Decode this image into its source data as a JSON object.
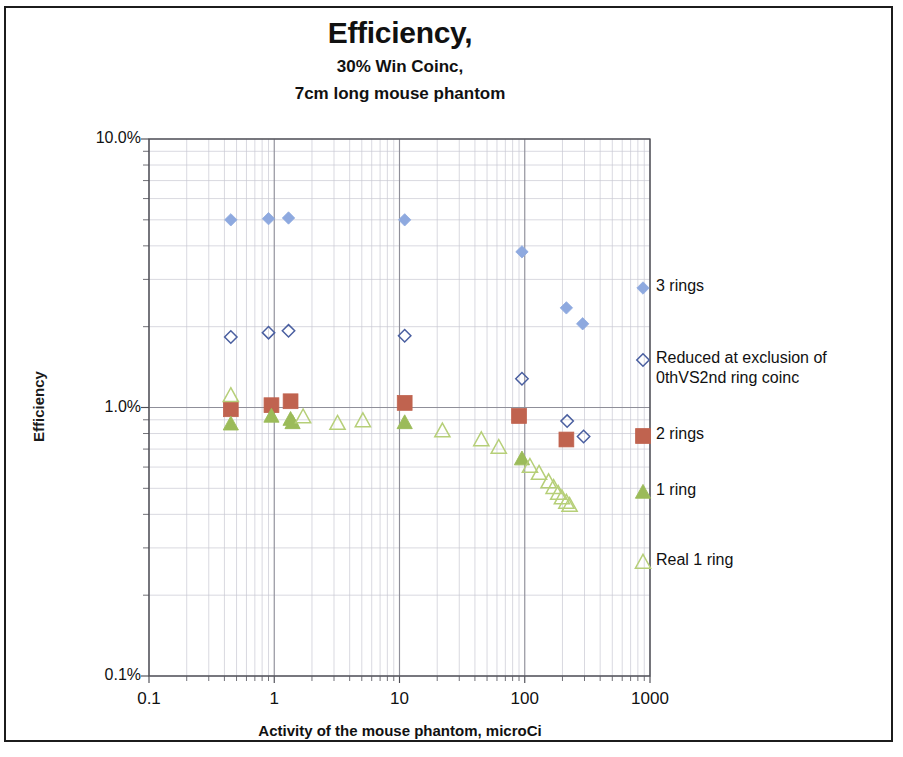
{
  "chart_data": {
    "type": "scatter",
    "title": "Efficiency,",
    "subtitle_line1": "30% Win Coinc,",
    "subtitle_line2": "7cm long mouse phantom",
    "xlabel": "Activity of the mouse phantom, microCi",
    "ylabel": "Efficiency",
    "xscale": "log",
    "yscale": "log",
    "xlim": [
      0.1,
      1000
    ],
    "ylim": [
      0.001,
      0.1
    ],
    "xticks": [
      "0.1",
      "1",
      "10",
      "100",
      "1000"
    ],
    "xtick_values": [
      0.1,
      1,
      10,
      100,
      1000
    ],
    "yticks": [
      "10.0%",
      "1.0%",
      "0.1%"
    ],
    "ytick_values": [
      0.1,
      0.01,
      0.001
    ],
    "grid": true,
    "grid_minor": true,
    "legend_position": "right",
    "series": [
      {
        "name": "3 rings",
        "marker": "filled-diamond",
        "color": "#8EA9DF",
        "points": [
          [
            0.45,
            0.05
          ],
          [
            0.9,
            0.0505
          ],
          [
            1.3,
            0.0508
          ],
          [
            11.0,
            0.05
          ],
          [
            95.0,
            0.038
          ],
          [
            215.0,
            0.0235
          ],
          [
            290.0,
            0.0205
          ]
        ]
      },
      {
        "name": "Reduced at exclusion of\n0thVS2nd ring coinc",
        "marker": "open-diamond",
        "color": "#4A5FA0",
        "points": [
          [
            0.45,
            0.0183
          ],
          [
            0.9,
            0.019
          ],
          [
            1.3,
            0.0193
          ],
          [
            11.0,
            0.0185
          ],
          [
            95.0,
            0.0128
          ],
          [
            218.0,
            0.0089
          ],
          [
            295.0,
            0.0078
          ]
        ]
      },
      {
        "name": "2 rings",
        "marker": "filled-square",
        "color": "#C0634F",
        "points": [
          [
            0.45,
            0.00985
          ],
          [
            0.95,
            0.0102
          ],
          [
            1.35,
            0.01055
          ],
          [
            11.0,
            0.0104
          ],
          [
            90.0,
            0.0093
          ],
          [
            215.0,
            0.0076
          ]
        ]
      },
      {
        "name": "1 ring",
        "marker": "filled-triangle",
        "color": "#9BBB59",
        "points": [
          [
            0.45,
            0.0087
          ],
          [
            0.95,
            0.0093
          ],
          [
            1.35,
            0.00905
          ],
          [
            1.4,
            0.0088
          ],
          [
            11.0,
            0.0088
          ],
          [
            95.0,
            0.00645
          ]
        ]
      },
      {
        "name": "Real 1 ring",
        "marker": "open-triangle",
        "color": "#B6CF78",
        "points": [
          [
            0.45,
            0.0111
          ],
          [
            1.7,
            0.00925
          ],
          [
            3.2,
            0.00875
          ],
          [
            5.1,
            0.00895
          ],
          [
            22.0,
            0.0082
          ],
          [
            45.0,
            0.0076
          ],
          [
            62.0,
            0.00712
          ],
          [
            110.0,
            0.00605
          ],
          [
            130.0,
            0.0057
          ],
          [
            155.0,
            0.0053
          ],
          [
            170.0,
            0.00505
          ],
          [
            185.0,
            0.0048
          ],
          [
            198.0,
            0.00462
          ],
          [
            215.0,
            0.00445
          ],
          [
            228.0,
            0.00433
          ]
        ]
      }
    ]
  },
  "legend": {
    "items": [
      {
        "label": "3 rings",
        "marker": "filled-diamond",
        "color": "#8EA9DF"
      },
      {
        "label": "Reduced at exclusion of\n0thVS2nd ring coinc",
        "marker": "open-diamond",
        "color": "#4A5FA0"
      },
      {
        "label": "2 rings",
        "marker": "filled-square",
        "color": "#C0634F"
      },
      {
        "label": "1 ring",
        "marker": "filled-triangle",
        "color": "#9BBB59"
      },
      {
        "label": "Real 1 ring",
        "marker": "open-triangle",
        "color": "#B6CF78"
      }
    ]
  },
  "colors": {
    "three_rings": "#8EA9DF",
    "reduced": "#4A5FA0",
    "two_rings": "#C0634F",
    "one_ring": "#9BBB59",
    "real_one_ring": "#B6CF78",
    "grid_major": "#8f8f99",
    "grid_minor": "#c8c8d2",
    "axis": "#4d4d55",
    "frame": "#1c1c1c"
  }
}
